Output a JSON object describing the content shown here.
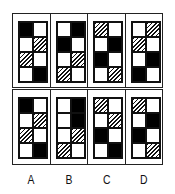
{
  "puzzle": {
    "legend": {
      "K": "black",
      "H": "hatched",
      "W": "white"
    },
    "question_panels": [
      {
        "cells": [
          [
            "K",
            "W"
          ],
          [
            "W",
            "H"
          ],
          [
            "H",
            "W"
          ],
          [
            "W",
            "K"
          ]
        ]
      },
      {
        "cells": [
          [
            "W",
            "K"
          ],
          [
            "K",
            "W"
          ],
          [
            "W",
            "H"
          ],
          [
            "H",
            "W"
          ]
        ]
      },
      {
        "cells": [
          [
            "H",
            "W"
          ],
          [
            "W",
            "K"
          ],
          [
            "K",
            "W"
          ],
          [
            "W",
            "H"
          ]
        ]
      },
      {
        "cells": [
          [
            "W",
            "H"
          ],
          [
            "H",
            "W"
          ],
          [
            "W",
            "K"
          ],
          [
            "K",
            "W"
          ]
        ]
      }
    ],
    "options": [
      {
        "label": "A",
        "cells": [
          [
            "K",
            "W"
          ],
          [
            "W",
            "H"
          ],
          [
            "H",
            "W"
          ],
          [
            "W",
            "K"
          ]
        ]
      },
      {
        "label": "B",
        "cells": [
          [
            "W",
            "K"
          ],
          [
            "W",
            "K"
          ],
          [
            "W",
            "H"
          ],
          [
            "H",
            "W"
          ]
        ]
      },
      {
        "label": "C",
        "cells": [
          [
            "H",
            "W"
          ],
          [
            "W",
            "H"
          ],
          [
            "K",
            "W"
          ],
          [
            "W",
            "K"
          ]
        ]
      },
      {
        "label": "D",
        "cells": [
          [
            "H",
            "W"
          ],
          [
            "W",
            "K"
          ],
          [
            "K",
            "W"
          ],
          [
            "W",
            "H"
          ]
        ]
      }
    ]
  }
}
